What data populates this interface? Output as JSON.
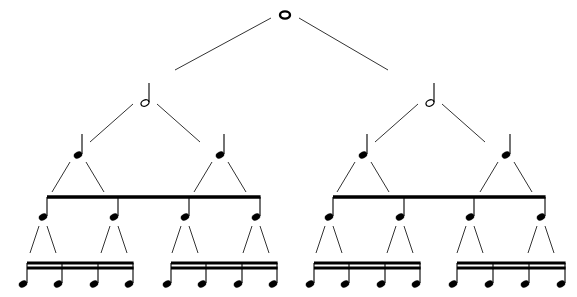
{
  "diagram": {
    "colors": {
      "background": "#ffffff",
      "ink": "#000000",
      "connector": "#333333"
    },
    "levels": [
      {
        "name": "whole",
        "label": "Whole note",
        "glyph": "whole-note-icon",
        "nodes": [
          {
            "x": 285,
            "y": 15
          }
        ]
      },
      {
        "name": "half",
        "label": "Half notes",
        "glyph": "half-note-icon",
        "nodes": [
          {
            "x": 145,
            "y": 97
          },
          {
            "x": 430,
            "y": 97
          }
        ]
      },
      {
        "name": "quarter",
        "label": "Quarter notes",
        "glyph": "quarter-note-icon",
        "nodes": [
          {
            "x": 78,
            "y": 150
          },
          {
            "x": 220,
            "y": 150
          },
          {
            "x": 363,
            "y": 150
          },
          {
            "x": 506,
            "y": 150
          }
        ]
      },
      {
        "name": "eighth",
        "label": "Eighth notes",
        "glyph": "eighth-note-icon",
        "beams": 1,
        "groups": [
          {
            "x1": 47,
            "x2": 260,
            "beam_y": 197,
            "stems": [
              47,
              118,
              189,
              260
            ],
            "head_y": 216
          },
          {
            "x1": 333,
            "x2": 545,
            "beam_y": 197,
            "stems": [
              333,
              404,
              474,
              545
            ],
            "head_y": 216
          }
        ]
      },
      {
        "name": "sixteenth",
        "label": "Sixteenth notes",
        "glyph": "sixteenth-note-icon",
        "beams": 2,
        "groups": [
          {
            "x1": 27,
            "x2": 133,
            "beam_y": 263,
            "stems": [
              27,
              62,
              98,
              133
            ],
            "head_y": 283
          },
          {
            "x1": 171,
            "x2": 277,
            "beam_y": 263,
            "stems": [
              171,
              206,
              242,
              277
            ],
            "head_y": 283
          },
          {
            "x1": 314,
            "x2": 420,
            "beam_y": 263,
            "stems": [
              314,
              349,
              385,
              420
            ],
            "head_y": 283
          },
          {
            "x1": 457,
            "x2": 565,
            "beam_y": 263,
            "stems": [
              457,
              493,
              529,
              565
            ],
            "head_y": 283
          }
        ]
      }
    ]
  }
}
